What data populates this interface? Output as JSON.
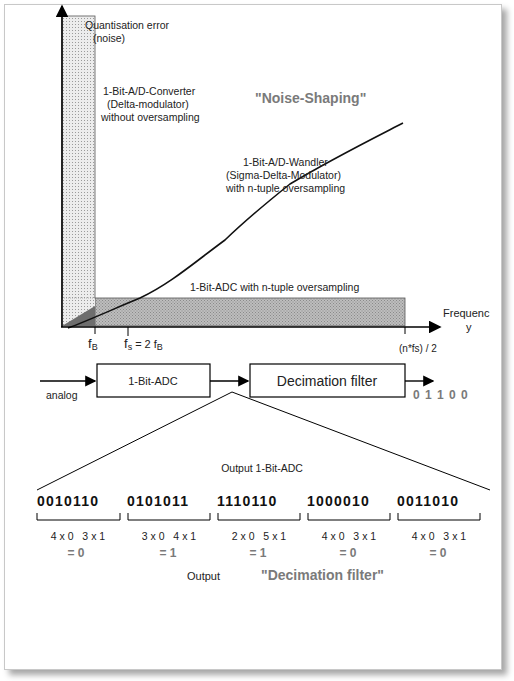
{
  "diagram": {
    "title": "\"Noise-Shaping\"",
    "y_axis_label_line1": "Quantisation error",
    "y_axis_label_line2": "(noise)",
    "x_axis_label_line1": "Frequenc",
    "x_axis_label_line2": "y",
    "x_end_label": "(n*fs) / 2",
    "fb_label": "f",
    "fb_sub": "B",
    "fs_label": "f",
    "fs_sub": "s",
    "fs_eq": "= 2 f",
    "fs_eq_sub": "B",
    "annot_delta_line1": "1-Bit-A/D-Converter",
    "annot_delta_line2": "(Delta-modulator)",
    "annot_delta_line3": "without oversampling",
    "annot_sigma_line1": "1-Bit-A/D-Wandler",
    "annot_sigma_line2": "(Sigma-Delta-Modulator)",
    "annot_sigma_line3": "with n-tuple oversampling",
    "annot_adc": "1-Bit-ADC with n-tuple oversampling",
    "colors": {
      "title": "#7a7a7a",
      "dotted_fill": "#e2e2e2",
      "hatched_fill": "#b4b4b4",
      "dark_fill": "#777777"
    }
  },
  "block_diagram": {
    "input_label": "analog",
    "adc_block": "1-Bit-ADC",
    "filter_block": "Decimation filter",
    "output_bits": "0 1 1 0 0",
    "output_caption": "Output 1-Bit-ADC",
    "bitstream_groups": [
      "0010110",
      "0101011",
      "1110110",
      "1000010",
      "0011010"
    ],
    "groups": [
      {
        "count": "4 x 0   3 x 1",
        "result": "= 0"
      },
      {
        "count": "3 x 0   4 x 1",
        "result": "= 1"
      },
      {
        "count": "2 x 0   5 x 1",
        "result": "= 1"
      },
      {
        "count": "4 x 0   3 x 1",
        "result": "= 0"
      },
      {
        "count": "4 x 0   3 x 1",
        "result": "= 0"
      }
    ],
    "footer_output": "Output",
    "footer_filter": "\"Decimation filter\""
  }
}
